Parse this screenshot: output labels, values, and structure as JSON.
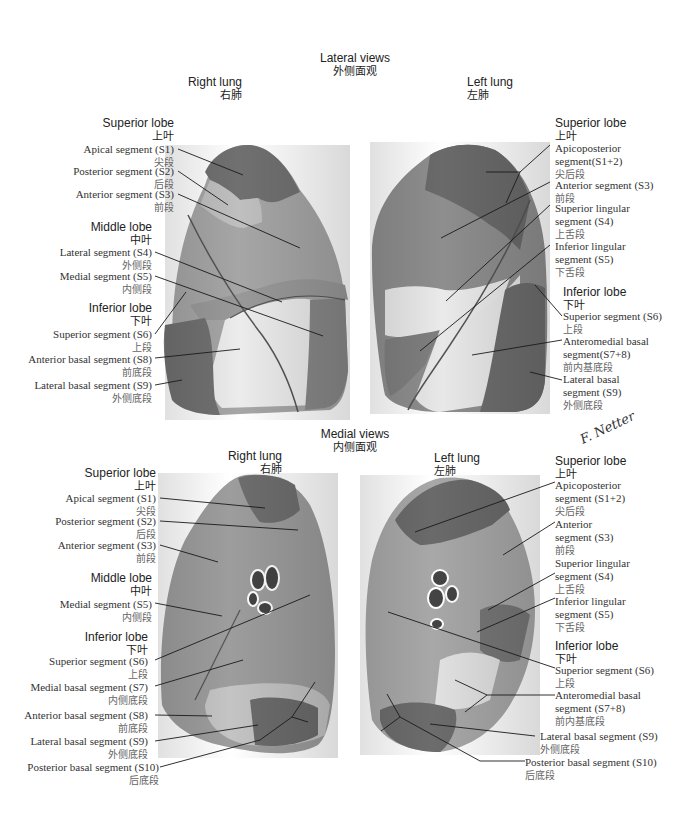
{
  "lateral": {
    "title_en": "Lateral views",
    "title_zh": "外侧面观",
    "right_lung": {
      "title_en": "Right lung",
      "title_zh": "右肺",
      "labels": [
        {
          "en": "Superior lobe",
          "zh": "上叶",
          "kind": "lobe"
        },
        {
          "en": "Apical segment (S1)",
          "zh": "尖段",
          "kind": "segment"
        },
        {
          "en": "Posterior segment (S2)",
          "zh": "后段",
          "kind": "segment"
        },
        {
          "en": "Anterior segment (S3)",
          "zh": "前段",
          "kind": "segment"
        },
        {
          "en": "Middle lobe",
          "zh": "中叶",
          "kind": "lobe"
        },
        {
          "en": "Lateral segment (S4)",
          "zh": "外侧段",
          "kind": "segment"
        },
        {
          "en": "Medial segment (S5)",
          "zh": "内侧段",
          "kind": "segment"
        },
        {
          "en": "Inferior lobe",
          "zh": "下叶",
          "kind": "lobe"
        },
        {
          "en": "Superior segment (S6)",
          "zh": "上段",
          "kind": "segment"
        },
        {
          "en": "Anterior basal segment (S8)",
          "zh": "前底段",
          "kind": "segment"
        },
        {
          "en": "Lateral basal segment (S9)",
          "zh": "外侧底段",
          "kind": "segment"
        }
      ]
    },
    "left_lung": {
      "title_en": "Left lung",
      "title_zh": "左肺",
      "labels": [
        {
          "en": "Superior lobe",
          "zh": "上叶",
          "kind": "lobe"
        },
        {
          "en": "Apicoposterior segment(S1+2)",
          "en1": "Apicoposterior",
          "en2": "segment(S1+2)",
          "zh": "尖后段",
          "kind": "segment"
        },
        {
          "en": "Anterior segment (S3)",
          "zh": "前段",
          "kind": "segment"
        },
        {
          "en": "Superior lingular segment (S4)",
          "en1": "Superior lingular",
          "en2": "segment (S4)",
          "zh": "上舌段",
          "kind": "segment"
        },
        {
          "en": "Inferior lingular segment (S5)",
          "en1": "Inferior lingular",
          "en2": "segment (S5)",
          "zh": "下舌段",
          "kind": "segment"
        },
        {
          "en": "Inferior lobe",
          "zh": "下叶",
          "kind": "lobe"
        },
        {
          "en": "Superior segment (S6)",
          "zh": "上段",
          "kind": "segment"
        },
        {
          "en": "Anteromedial basal segment(S7+8)",
          "en1": "Anteromedial basal",
          "en2": "segment(S7+8)",
          "zh": "前内基底段",
          "kind": "segment"
        },
        {
          "en": "Lateral basal segment (S9)",
          "en1": "Lateral basal",
          "en2": "segment (S9)",
          "zh": "外侧底段",
          "kind": "segment"
        }
      ]
    }
  },
  "medial": {
    "title_en": "Medial views",
    "title_zh": "内侧面观",
    "right_lung": {
      "title_en": "Right lung",
      "title_zh": "右肺",
      "labels": [
        {
          "en": "Superior lobe",
          "zh": "上叶",
          "kind": "lobe"
        },
        {
          "en": "Apical segment (S1)",
          "zh": "尖段",
          "kind": "segment"
        },
        {
          "en": "Posterior segment (S2)",
          "zh": "后段",
          "kind": "segment"
        },
        {
          "en": "Anterior segment (S3)",
          "zh": "前段",
          "kind": "segment"
        },
        {
          "en": "Middle lobe",
          "zh": "中叶",
          "kind": "lobe"
        },
        {
          "en": "Medial segment (S5)",
          "zh": "内侧段",
          "kind": "segment"
        },
        {
          "en": "Inferior lobe",
          "zh": "下叶",
          "kind": "lobe"
        },
        {
          "en": "Superior segment (S6)",
          "zh": "上段",
          "kind": "segment"
        },
        {
          "en": "Medial basal segment (S7)",
          "zh": "内侧底段",
          "kind": "segment"
        },
        {
          "en": "Anterior basal segment (S8)",
          "zh": "前底段",
          "kind": "segment"
        },
        {
          "en": "Lateral basal segment (S9)",
          "zh": "外侧底段",
          "kind": "segment"
        },
        {
          "en": "Posterior basal segment (S10)",
          "zh": "后底段",
          "kind": "segment"
        }
      ]
    },
    "left_lung": {
      "title_en": "Left lung",
      "title_zh": "左肺",
      "labels": [
        {
          "en": "Superior lobe",
          "zh": "上叶",
          "kind": "lobe"
        },
        {
          "en": "Apicoposterior segment (S1+2)",
          "en1": "Apicoposterior",
          "en2": "segment (S1+2)",
          "zh": "尖后段",
          "kind": "segment"
        },
        {
          "en": "Anterior segment (S3)",
          "en1": "Anterior",
          "en2": "segment (S3)",
          "zh": "前段",
          "kind": "segment"
        },
        {
          "en": "Superior lingular segment (S4)",
          "en1": "Superior lingular",
          "en2": "segment (S4)",
          "zh": "上舌段",
          "kind": "segment"
        },
        {
          "en": "Inferior lingular segment (S5)",
          "en1": "Inferior lingular",
          "en2": "segment (S5)",
          "zh": "下舌段",
          "kind": "segment"
        },
        {
          "en": "Inferior lobe",
          "zh": "下叶",
          "kind": "lobe"
        },
        {
          "en": "Superior segment (S6)",
          "zh": "上段",
          "kind": "segment"
        },
        {
          "en": "Anteromedial basal segment (S7+8)",
          "en1": "Anteromedial basal",
          "en2": "segment (S7+8)",
          "zh": "前内基底段",
          "kind": "segment"
        },
        {
          "en": "Lateral basal segment (S9)",
          "zh": "外侧底段",
          "kind": "segment"
        },
        {
          "en": "Posterior basal segment (S10)",
          "zh": "后底段",
          "kind": "segment"
        }
      ]
    }
  },
  "signature": "F. Netter",
  "colors": {
    "background": "#ffffff",
    "segment_dark": "#6e6e6e",
    "segment_mid": "#8c8c8c",
    "segment_light": "#b4b4b4",
    "segment_pale": "#e6e6e6",
    "leader_line": "#1a1a1a",
    "label_text": "#333333"
  }
}
